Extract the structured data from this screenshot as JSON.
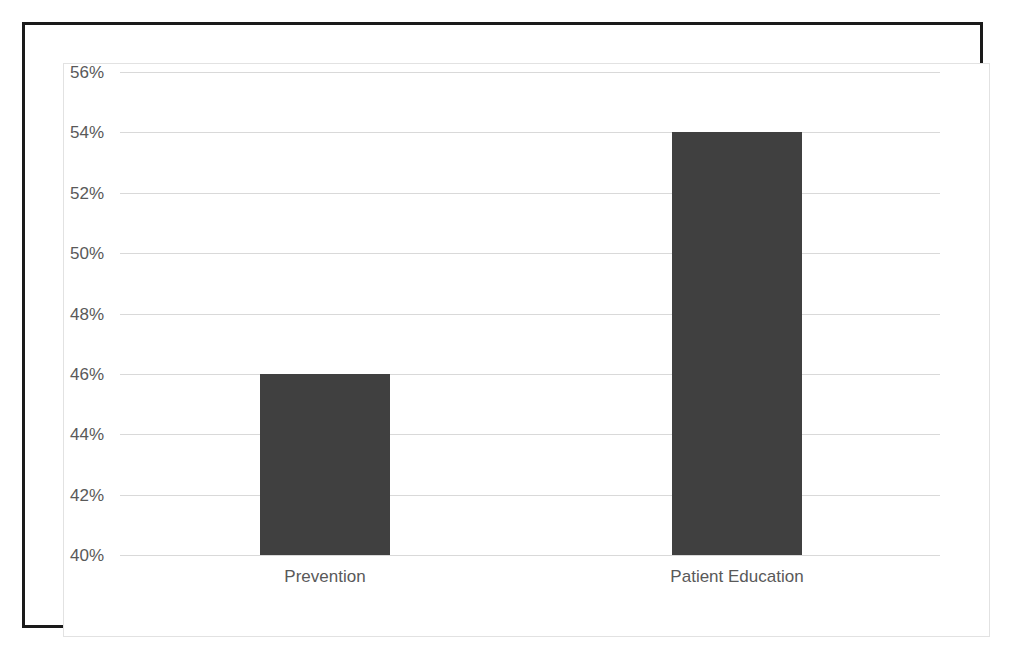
{
  "chart_data": {
    "type": "bar",
    "title": "",
    "subtitle": "",
    "xlabel": "",
    "ylabel": "",
    "categories": [
      "Prevention",
      "Patient Education"
    ],
    "values": [
      46,
      54
    ],
    "value_labels": [
      "46%",
      "54%"
    ],
    "ylim": [
      40,
      56
    ],
    "ytick_values": [
      56,
      54,
      52,
      50,
      48,
      46,
      44,
      42,
      40
    ],
    "ytick_labels": [
      "56%",
      "54%",
      "52%",
      "50%",
      "48%",
      "46%",
      "44%",
      "42%",
      "40%"
    ],
    "ytick_step": 2,
    "grid": true,
    "grid_axis": "y",
    "legend": false,
    "legend_position": "none",
    "series": [
      {
        "name": "",
        "values": [
          46,
          54
        ]
      }
    ]
  },
  "style": {
    "bar_color": "#404040",
    "gridline_color": "#d9d9d9",
    "text_color": "#595959",
    "outer_border_color": "#1a1a1a",
    "chart_frame_color": "#e2e2e2",
    "background_color": "#ffffff"
  }
}
